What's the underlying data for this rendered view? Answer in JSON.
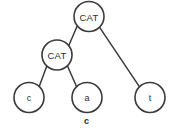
{
  "figure": {
    "caption": "c",
    "type": "tree-diagram",
    "width": 173,
    "height": 136,
    "background_color": "#ffffff",
    "stroke_color": "#3b3b3b",
    "text_color": "#2e2e2e"
  },
  "tree": {
    "node_radius": 15,
    "nodes": [
      {
        "id": "root",
        "label": "CAT",
        "kind": "internal",
        "cx": 89,
        "cy": 16.5
      },
      {
        "id": "inner",
        "label": "CAT",
        "kind": "internal",
        "cx": 57,
        "cy": 55
      },
      {
        "id": "leaf-c",
        "label": "c",
        "kind": "leaf",
        "cx": 29,
        "cy": 97.5
      },
      {
        "id": "leaf-a",
        "label": "a",
        "kind": "leaf",
        "cx": 87,
        "cy": 97.5
      },
      {
        "id": "leaf-t",
        "label": "t",
        "kind": "leaf",
        "cx": 150,
        "cy": 97.5
      }
    ],
    "edges": [
      {
        "id": "edge-root-inner",
        "from": "root",
        "to": "inner",
        "x1": 77.3,
        "y1": 25.8,
        "x2": 68.7,
        "y2": 45.7
      },
      {
        "id": "edge-root-leaf-t",
        "from": "root",
        "to": "leaf-t",
        "x1": 99.8,
        "y1": 27.6,
        "x2": 139.2,
        "y2": 86.3
      },
      {
        "id": "edge-inner-leaf-c",
        "from": "inner",
        "to": "leaf-c",
        "x1": 46.8,
        "y1": 66.0,
        "x2": 39.2,
        "y2": 86.5
      },
      {
        "id": "edge-inner-leaf-a",
        "from": "inner",
        "to": "leaf-a",
        "x1": 67.6,
        "y1": 66.2,
        "x2": 76.4,
        "y2": 86.3
      }
    ]
  }
}
